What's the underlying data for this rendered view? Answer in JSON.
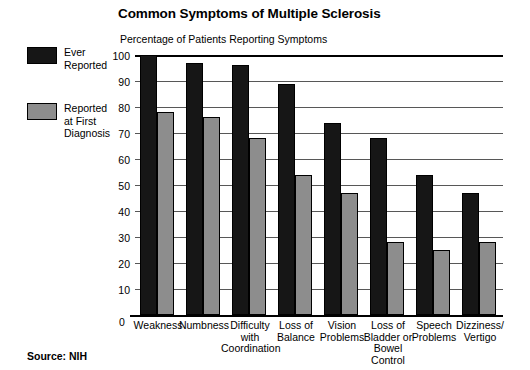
{
  "chart_data": {
    "type": "bar",
    "title": "Common Symptoms of Multiple Sclerosis",
    "subtitle": "Percentage of Patients Reporting Symptoms",
    "xlabel": "",
    "ylabel": "",
    "ylim": [
      0,
      100
    ],
    "yticks": [
      0,
      10,
      20,
      30,
      40,
      50,
      60,
      70,
      80,
      90,
      100
    ],
    "grid": true,
    "legend_position": "left",
    "categories": [
      "Weakness",
      "Numbness",
      "Difficulty\nwith\nCoordination",
      "Loss of\nBalance",
      "Vision\nProblems",
      "Loss of\nBladder or\nBowel\nControl",
      "Speech\nProblems",
      "Dizziness/\nVertigo"
    ],
    "series": [
      {
        "name": "Ever Reported",
        "color": "#161616",
        "values": [
          100,
          97,
          96,
          89,
          74,
          68,
          54,
          47
        ]
      },
      {
        "name": "Reported at First Diagnosis",
        "color": "#8d8d8d",
        "values": [
          78,
          76,
          68,
          54,
          47,
          28,
          25,
          28
        ]
      }
    ],
    "source": "Source: NIH"
  },
  "legend": {
    "items": [
      {
        "label": "Ever\nReported",
        "swatch": "dark"
      },
      {
        "label": "Reported\nat First\nDiagnosis",
        "swatch": "gray"
      }
    ]
  }
}
